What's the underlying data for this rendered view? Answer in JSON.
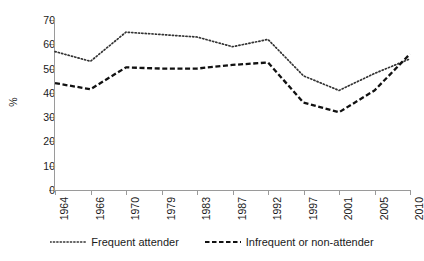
{
  "chart_data": {
    "type": "line",
    "title": "",
    "xlabel": "",
    "ylabel": "%",
    "ylim": [
      0,
      70
    ],
    "ytick_step": 10,
    "yticks": [
      70,
      60,
      50,
      40,
      30,
      20,
      10,
      0
    ],
    "grid": false,
    "legend_position": "bottom",
    "xtick_rotation": -90,
    "categories": [
      "1964",
      "1966",
      "1970",
      "1979",
      "1983",
      "1987",
      "1992",
      "1997",
      "2001",
      "2005",
      "2010"
    ],
    "series": [
      {
        "name": "Frequent attender",
        "style": "dotted",
        "color": "#333333",
        "values": [
          57,
          53,
          65,
          64,
          63,
          59,
          62,
          47,
          41,
          48,
          54
        ]
      },
      {
        "name": "Infrequent or non-attender",
        "style": "dashed",
        "color": "#111111",
        "values": [
          44,
          41.5,
          50.5,
          50,
          50,
          51.5,
          52.5,
          36,
          32,
          41,
          56
        ]
      }
    ]
  },
  "legend": {
    "items": [
      {
        "label": "Frequent attender"
      },
      {
        "label": "Infrequent or non-attender"
      }
    ]
  }
}
